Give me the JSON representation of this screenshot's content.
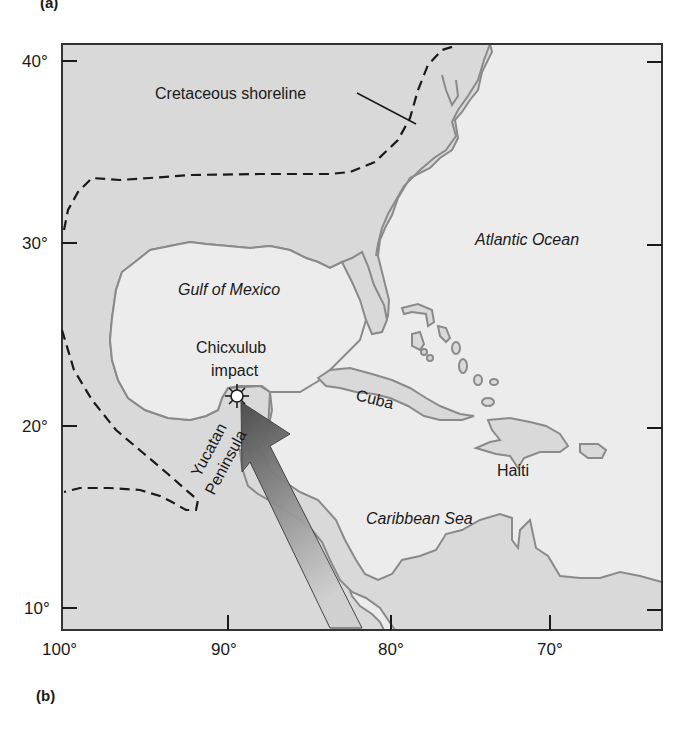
{
  "figure": {
    "panel_top_label": "(a)",
    "panel_bottom_label": "(b)"
  },
  "map": {
    "y_axis": [
      "40°",
      "30°",
      "20°",
      "10°"
    ],
    "x_axis": [
      "100°",
      "90°",
      "80°",
      "70°"
    ],
    "labels": {
      "shoreline": "Cretaceous shoreline",
      "atlantic": "Atlantic Ocean",
      "gulf": "Gulf of Mexico",
      "impact_line1": "Chicxulub",
      "impact_line2": "impact",
      "yucatan": "Yucatan",
      "peninsula": "Peninsula",
      "cuba": "Cuba",
      "haiti": "Haiti",
      "caribbean": "Caribbean Sea"
    },
    "colors": {
      "land": "#d9d9d9",
      "sea": "#ececec",
      "coast": "#8a8a8a",
      "arrow_dark": "#555555",
      "arrow_light": "#bdbdbd"
    }
  }
}
